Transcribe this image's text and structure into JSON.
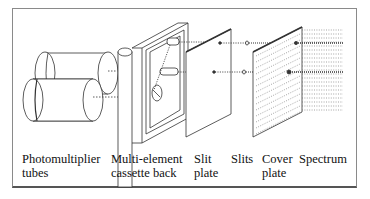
{
  "diagram": {
    "type": "exploded-view",
    "components": [
      {
        "id": "photomultiplier-tubes",
        "label_line1": "Photomultiplier",
        "label_line2": "tubes"
      },
      {
        "id": "cassette-back",
        "label_line1": "Multi-element",
        "label_line2": "cassette back"
      },
      {
        "id": "slit-plate",
        "label_line1": "Slit",
        "label_line2": "plate"
      },
      {
        "id": "slits",
        "label_line1": "Slits",
        "label_line2": ""
      },
      {
        "id": "cover-plate",
        "label_line1": "Cover",
        "label_line2": "plate"
      },
      {
        "id": "spectrum",
        "label_line1": "Spectrum",
        "label_line2": ""
      }
    ],
    "colors": {
      "line": "#333333",
      "frame": "#8a8a8a",
      "background": "#ffffff"
    }
  }
}
